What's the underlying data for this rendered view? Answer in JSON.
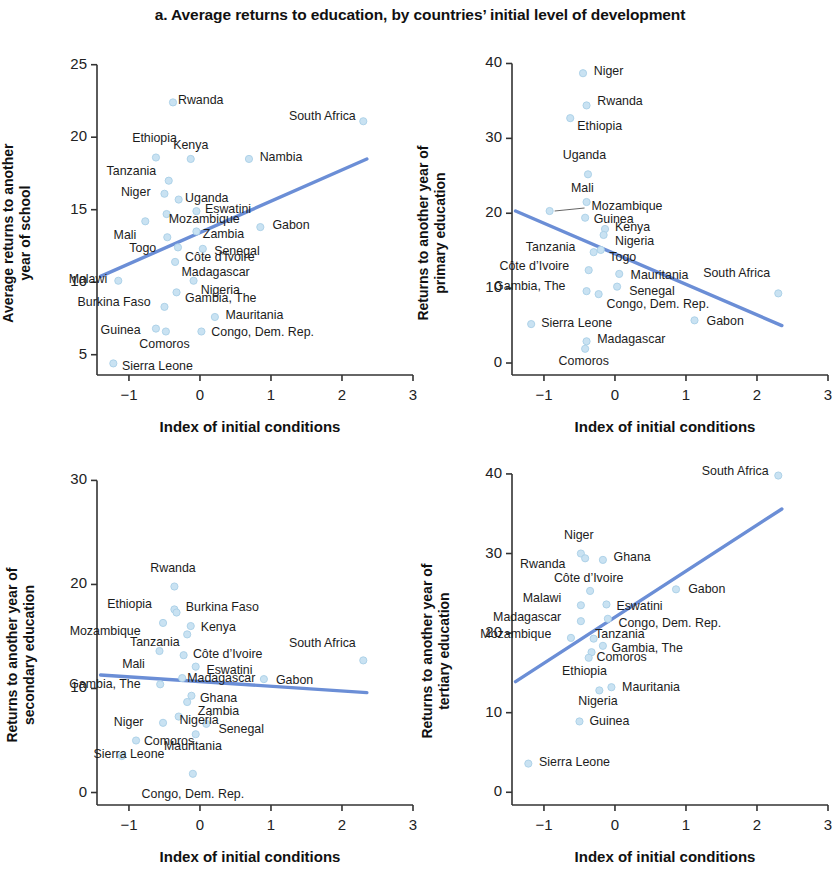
{
  "figure": {
    "title": "a. Average returns to education, by countries’ initial level of development",
    "marker_color": "#c9e2f2",
    "marker_edge_color": "#a9cfe6",
    "trendline_color": "#6b8ed6",
    "axis_color": "#333333"
  },
  "axis": {
    "x_title": "Index of initial conditions"
  },
  "chart_data": [
    {
      "id": "panel-a1",
      "type": "scatter",
      "title": "",
      "xlabel": "Index of initial conditions",
      "ylabel": "Average returns to another year of school",
      "xlim": [
        -1.45,
        3.0
      ],
      "ylim": [
        3.6,
        25.6
      ],
      "xticks": [
        -1,
        0,
        1,
        2,
        3
      ],
      "xticklabels": [
        "−1",
        "0",
        "1",
        "2",
        "3"
      ],
      "yticks": [
        5,
        10,
        15,
        20,
        25
      ],
      "yticklabels": [
        "5",
        "10",
        "15",
        "20",
        "25"
      ],
      "grid": false,
      "legend": "none",
      "trendline": {
        "x0": -1.4,
        "y0": 10.4,
        "x1": 2.35,
        "y1": 18.5
      },
      "points": [
        {
          "label": "Rwanda",
          "x": -0.38,
          "y": 22.4,
          "lx": 0.0,
          "ly": 0.0,
          "align": "left"
        },
        {
          "label": "South Africa",
          "x": 2.3,
          "y": 21.1,
          "lx": -0.05,
          "ly": 0.2,
          "align": "right"
        },
        {
          "label": "Ethiopia",
          "x": -0.62,
          "y": 18.6,
          "lx": -0.02,
          "ly": 1.2,
          "align": "center"
        },
        {
          "label": "Kenya",
          "x": -0.13,
          "y": 18.5,
          "lx": 0.0,
          "ly": 0.85,
          "align": "center"
        },
        {
          "label": "Nambia",
          "x": 0.69,
          "y": 18.5,
          "lx": 0.08,
          "ly": 0.0,
          "align": "left"
        },
        {
          "label": "Tanzania",
          "x": -0.44,
          "y": 17.0,
          "lx": -0.12,
          "ly": 0.5,
          "align": "right"
        },
        {
          "label": "Niger",
          "x": -0.5,
          "y": 16.1,
          "lx": -0.14,
          "ly": 0.0,
          "align": "right"
        },
        {
          "label": "Uganda",
          "x": -0.3,
          "y": 15.7,
          "lx": 0.02,
          "ly": 0.0,
          "align": "left"
        },
        {
          "label": "Eswatini",
          "x": -0.05,
          "y": 14.9,
          "lx": 0.05,
          "ly": 0.0,
          "align": "left"
        },
        {
          "label": "Mozambique",
          "x": -0.47,
          "y": 14.7,
          "lx": -0.04,
          "ly": -0.5,
          "align": "left"
        },
        {
          "label": "Gabon",
          "x": 0.85,
          "y": 13.8,
          "lx": 0.1,
          "ly": 0.0,
          "align": "left"
        },
        {
          "label": "Mali",
          "x": -0.77,
          "y": 14.2,
          "lx": -0.07,
          "ly": -1.1,
          "align": "right"
        },
        {
          "label": "Zambia",
          "x": -0.05,
          "y": 13.5,
          "lx": 0.02,
          "ly": -0.3,
          "align": "left"
        },
        {
          "label": "Togo",
          "x": -0.46,
          "y": 13.1,
          "lx": -0.1,
          "ly": -0.9,
          "align": "right"
        },
        {
          "label": "Senegal",
          "x": 0.04,
          "y": 12.3,
          "lx": 0.09,
          "ly": -0.3,
          "align": "left"
        },
        {
          "label": "Côte d’Ivoire",
          "x": -0.31,
          "y": 12.4,
          "lx": 0.03,
          "ly": -0.8,
          "align": "left"
        },
        {
          "label": "Madagascar",
          "x": -0.35,
          "y": 11.4,
          "lx": 0.02,
          "ly": -0.8,
          "align": "left"
        },
        {
          "label": "Malawi",
          "x": -1.15,
          "y": 10.1,
          "lx": -0.1,
          "ly": 0.0,
          "align": "right"
        },
        {
          "label": "Nigeria",
          "x": -0.09,
          "y": 10.1,
          "lx": 0.03,
          "ly": -0.8,
          "align": "left"
        },
        {
          "label": "Gambia, The",
          "x": -0.33,
          "y": 9.3,
          "lx": 0.05,
          "ly": -0.55,
          "align": "left"
        },
        {
          "label": "Burkina Faso",
          "x": -0.5,
          "y": 8.3,
          "lx": -0.14,
          "ly": 0.2,
          "align": "right"
        },
        {
          "label": "Mauritania",
          "x": 0.21,
          "y": 7.6,
          "lx": 0.08,
          "ly": 0.0,
          "align": "left"
        },
        {
          "label": "Guinea",
          "x": -0.62,
          "y": 6.8,
          "lx": -0.16,
          "ly": -0.25,
          "align": "right"
        },
        {
          "label": "Congo, Dem. Rep.",
          "x": 0.02,
          "y": 6.6,
          "lx": 0.07,
          "ly": -0.15,
          "align": "left"
        },
        {
          "label": "Comoros",
          "x": -0.48,
          "y": 6.6,
          "lx": -0.02,
          "ly": -1.0,
          "align": "center"
        },
        {
          "label": "Sierra Leone",
          "x": -1.22,
          "y": 4.4,
          "lx": 0.05,
          "ly": -0.35,
          "align": "left"
        }
      ]
    },
    {
      "id": "panel-a2",
      "type": "scatter",
      "title": "",
      "xlabel": "Index of initial conditions",
      "ylabel": "Returns to another year of primary education",
      "xlim": [
        -1.45,
        3.0
      ],
      "ylim": [
        -1.6,
        41.0
      ],
      "xticks": [
        -1,
        0,
        1,
        2,
        3
      ],
      "xticklabels": [
        "−1",
        "0",
        "1",
        "2",
        "3"
      ],
      "yticks": [
        0,
        10,
        20,
        30,
        40
      ],
      "yticklabels": [
        "0",
        "10",
        "20",
        "30",
        "40"
      ],
      "grid": false,
      "legend": "none",
      "trendline": {
        "x0": -1.4,
        "y0": 20.3,
        "x1": 2.35,
        "y1": 5.0
      },
      "points": [
        {
          "label": "Niger",
          "x": -0.45,
          "y": 38.7,
          "lx": 0.08,
          "ly": 0.0,
          "align": "left"
        },
        {
          "label": "Rwanda",
          "x": -0.4,
          "y": 34.4,
          "lx": 0.08,
          "ly": 0.3,
          "align": "left"
        },
        {
          "label": "Ethiopia",
          "x": -0.63,
          "y": 32.7,
          "lx": 0.03,
          "ly": -1.3,
          "align": "left"
        },
        {
          "label": "Uganda",
          "x": -0.38,
          "y": 25.2,
          "lx": -0.05,
          "ly": 2.3,
          "align": "center"
        },
        {
          "label": "Mali",
          "x": -0.4,
          "y": 21.5,
          "lx": -0.06,
          "ly": 1.6,
          "align": "center"
        },
        {
          "label": "Mozambique",
          "x": -0.92,
          "y": 20.3,
          "lx": 0.52,
          "ly": 0.4,
          "align": "left",
          "leader": true
        },
        {
          "label": "Guinea",
          "x": -0.42,
          "y": 19.4,
          "lx": 0.05,
          "ly": -0.4,
          "align": "left"
        },
        {
          "label": "Kenya",
          "x": -0.14,
          "y": 17.9,
          "lx": 0.07,
          "ly": 0.0,
          "align": "left"
        },
        {
          "label": "Nigeria",
          "x": -0.16,
          "y": 17.1,
          "lx": 0.09,
          "ly": -1.1,
          "align": "left"
        },
        {
          "label": "Togo",
          "x": -0.2,
          "y": 15.1,
          "lx": 0.05,
          "ly": -1.2,
          "align": "left"
        },
        {
          "label": "Tanzania",
          "x": -0.3,
          "y": 14.8,
          "lx": -0.2,
          "ly": 0.4,
          "align": "right"
        },
        {
          "label": "Côte d’Ivoire",
          "x": -0.37,
          "y": 12.4,
          "lx": -0.22,
          "ly": 0.3,
          "align": "right"
        },
        {
          "label": "Mauritania",
          "x": 0.06,
          "y": 11.9,
          "lx": 0.09,
          "ly": -0.4,
          "align": "left"
        },
        {
          "label": "South Africa",
          "x": 2.3,
          "y": 9.3,
          "lx": -0.06,
          "ly": 2.5,
          "align": "right"
        },
        {
          "label": "Senegal",
          "x": 0.03,
          "y": 10.2,
          "lx": 0.1,
          "ly": -0.8,
          "align": "left"
        },
        {
          "label": "Gambia, The",
          "x": -0.4,
          "y": 9.6,
          "lx": -0.24,
          "ly": 0.4,
          "align": "right"
        },
        {
          "label": "Congo, Dem. Rep.",
          "x": -0.23,
          "y": 9.2,
          "lx": 0.04,
          "ly": -1.6,
          "align": "left"
        },
        {
          "label": "Gabon",
          "x": 1.12,
          "y": 5.7,
          "lx": 0.1,
          "ly": -0.3,
          "align": "left"
        },
        {
          "label": "Sierra Leone",
          "x": -1.18,
          "y": 5.2,
          "lx": 0.07,
          "ly": -0.1,
          "align": "left"
        },
        {
          "label": "Madagascar",
          "x": -0.4,
          "y": 2.9,
          "lx": 0.08,
          "ly": 0.1,
          "align": "left"
        },
        {
          "label": "Comoros",
          "x": -0.42,
          "y": 1.9,
          "lx": -0.02,
          "ly": -1.9,
          "align": "center"
        }
      ]
    },
    {
      "id": "panel-a3",
      "type": "scatter",
      "title": "",
      "xlabel": "Index of initial conditions",
      "ylabel": "Returns to another year of secondary education",
      "xlim": [
        -1.45,
        3.0
      ],
      "ylim": [
        -1.2,
        31.0
      ],
      "xticks": [
        -1,
        0,
        1,
        2,
        3
      ],
      "xticklabels": [
        "−1",
        "0",
        "1",
        "2",
        "3"
      ],
      "yticks": [
        0,
        10,
        20,
        30
      ],
      "yticklabels": [
        "0",
        "10",
        "20",
        "30"
      ],
      "grid": false,
      "legend": "none",
      "trendline": {
        "x0": -1.4,
        "y0": 11.3,
        "x1": 2.35,
        "y1": 9.6
      },
      "points": [
        {
          "label": "Rwanda",
          "x": -0.36,
          "y": 19.8,
          "lx": -0.02,
          "ly": 1.6,
          "align": "center"
        },
        {
          "label": "Ethiopia",
          "x": -0.36,
          "y": 17.6,
          "lx": -0.26,
          "ly": 0.3,
          "align": "right"
        },
        {
          "label": "Burkina Faso",
          "x": -0.33,
          "y": 17.3,
          "lx": 0.06,
          "ly": 0.3,
          "align": "left"
        },
        {
          "label": "Kenya",
          "x": -0.13,
          "y": 16.0,
          "lx": 0.07,
          "ly": -0.3,
          "align": "left"
        },
        {
          "label": "Mozambique",
          "x": -0.52,
          "y": 16.3,
          "lx": -0.26,
          "ly": -1.0,
          "align": "right"
        },
        {
          "label": "Tanzania",
          "x": -0.18,
          "y": 15.2,
          "lx": -0.05,
          "ly": -0.9,
          "align": "right"
        },
        {
          "label": "South Africa",
          "x": 2.3,
          "y": 12.7,
          "lx": -0.05,
          "ly": 1.5,
          "align": "right"
        },
        {
          "label": "Côte d’Ivoire",
          "x": -0.23,
          "y": 13.2,
          "lx": 0.06,
          "ly": -0.1,
          "align": "left"
        },
        {
          "label": "Mali",
          "x": -0.57,
          "y": 13.6,
          "lx": -0.15,
          "ly": -1.4,
          "align": "right"
        },
        {
          "label": "Eswatini",
          "x": -0.06,
          "y": 12.1,
          "lx": 0.08,
          "ly": -0.5,
          "align": "left"
        },
        {
          "label": "Madagascar",
          "x": -0.25,
          "y": 11.0,
          "lx": 0.0,
          "ly": -0.2,
          "align": "left"
        },
        {
          "label": "Gabon",
          "x": 0.9,
          "y": 10.9,
          "lx": 0.1,
          "ly": -0.3,
          "align": "left"
        },
        {
          "label": "Gambia, The",
          "x": -0.56,
          "y": 10.4,
          "lx": -0.22,
          "ly": -0.2,
          "align": "right"
        },
        {
          "label": "Ghana",
          "x": -0.12,
          "y": 9.3,
          "lx": 0.05,
          "ly": -0.4,
          "align": "left"
        },
        {
          "label": "Zambia",
          "x": -0.18,
          "y": 8.7,
          "lx": 0.08,
          "ly": -1.1,
          "align": "left"
        },
        {
          "label": "Nigeria",
          "x": -0.3,
          "y": 7.3,
          "lx": -0.06,
          "ly": -0.5,
          "align": "left"
        },
        {
          "label": "Niger",
          "x": -0.52,
          "y": 6.7,
          "lx": -0.22,
          "ly": -0.1,
          "align": "right"
        },
        {
          "label": "Senegal",
          "x": 0.09,
          "y": 6.6,
          "lx": 0.1,
          "ly": -0.7,
          "align": "left"
        },
        {
          "label": "Comoros",
          "x": -0.9,
          "y": 5.0,
          "lx": 0.04,
          "ly": -0.2,
          "align": "left"
        },
        {
          "label": "Mauritania",
          "x": -0.06,
          "y": 5.6,
          "lx": -0.04,
          "ly": -1.3,
          "align": "center"
        },
        {
          "label": "Sierra Leone",
          "x": -1.1,
          "y": 3.5,
          "lx": 0.1,
          "ly": 0.0,
          "align": "center"
        },
        {
          "label": "Congo, Dem. Rep.",
          "x": -0.1,
          "y": 1.8,
          "lx": 0.0,
          "ly": -2.1,
          "align": "center"
        }
      ]
    },
    {
      "id": "panel-a4",
      "type": "scatter",
      "title": "",
      "xlabel": "Index of initial conditions",
      "ylabel": "Returns to another year of tertiary education",
      "xlim": [
        -1.45,
        3.0
      ],
      "ylim": [
        -1.6,
        41.5
      ],
      "xticks": [
        -1,
        0,
        1,
        2,
        3
      ],
      "xticklabels": [
        "−1",
        "0",
        "1",
        "2",
        "3"
      ],
      "yticks": [
        0,
        10,
        20,
        30,
        40
      ],
      "yticklabels": [
        "0",
        "10",
        "20",
        "30",
        "40"
      ],
      "grid": false,
      "legend": "none",
      "trendline": {
        "x0": -1.4,
        "y0": 13.9,
        "x1": 2.35,
        "y1": 35.6
      },
      "points": [
        {
          "label": "South Africa",
          "x": 2.3,
          "y": 39.8,
          "lx": -0.08,
          "ly": 0.3,
          "align": "right"
        },
        {
          "label": "Niger",
          "x": -0.48,
          "y": 30.0,
          "lx": -0.03,
          "ly": 2.1,
          "align": "center"
        },
        {
          "label": "Ghana",
          "x": -0.17,
          "y": 29.2,
          "lx": 0.08,
          "ly": 0.1,
          "align": "left"
        },
        {
          "label": "Rwanda",
          "x": -0.42,
          "y": 29.4,
          "lx": -0.22,
          "ly": -1.0,
          "align": "right"
        },
        {
          "label": "Côte d’Ivoire",
          "x": -0.35,
          "y": 25.3,
          "lx": -0.02,
          "ly": 1.4,
          "align": "center"
        },
        {
          "label": "Gabon",
          "x": 0.86,
          "y": 25.5,
          "lx": 0.1,
          "ly": -0.2,
          "align": "left"
        },
        {
          "label": "Malawi",
          "x": -0.48,
          "y": 23.5,
          "lx": -0.22,
          "ly": 0.6,
          "align": "right"
        },
        {
          "label": "Eswatini",
          "x": -0.12,
          "y": 23.6,
          "lx": 0.07,
          "ly": -0.4,
          "align": "left"
        },
        {
          "label": "Madagascar",
          "x": -0.48,
          "y": 21.5,
          "lx": -0.22,
          "ly": 0.3,
          "align": "right"
        },
        {
          "label": "Congo, Dem. Rep.",
          "x": -0.1,
          "y": 21.8,
          "lx": 0.08,
          "ly": -0.8,
          "align": "left"
        },
        {
          "label": "Mozambique",
          "x": -0.62,
          "y": 19.4,
          "lx": -0.22,
          "ly": 0.2,
          "align": "right"
        },
        {
          "label": "Tanzania",
          "x": -0.3,
          "y": 19.3,
          "lx": -0.05,
          "ly": 0.3,
          "align": "left"
        },
        {
          "label": "Gambia, The",
          "x": -0.17,
          "y": 18.4,
          "lx": 0.05,
          "ly": -0.5,
          "align": "left"
        },
        {
          "label": "Comoros",
          "x": -0.33,
          "y": 17.6,
          "lx": 0.0,
          "ly": -0.9,
          "align": "left"
        },
        {
          "label": "Ethiopia",
          "x": -0.37,
          "y": 16.9,
          "lx": -0.06,
          "ly": -1.9,
          "align": "center"
        },
        {
          "label": "Mauritania",
          "x": -0.05,
          "y": 13.2,
          "lx": 0.08,
          "ly": -0.2,
          "align": "left"
        },
        {
          "label": "Nigeria",
          "x": -0.22,
          "y": 12.8,
          "lx": -0.02,
          "ly": -1.6,
          "align": "center"
        },
        {
          "label": "Guinea",
          "x": -0.5,
          "y": 8.9,
          "lx": 0.07,
          "ly": -0.2,
          "align": "left"
        },
        {
          "label": "Sierra Leone",
          "x": -1.22,
          "y": 3.6,
          "lx": 0.08,
          "ly": -0.1,
          "align": "left"
        }
      ]
    }
  ]
}
